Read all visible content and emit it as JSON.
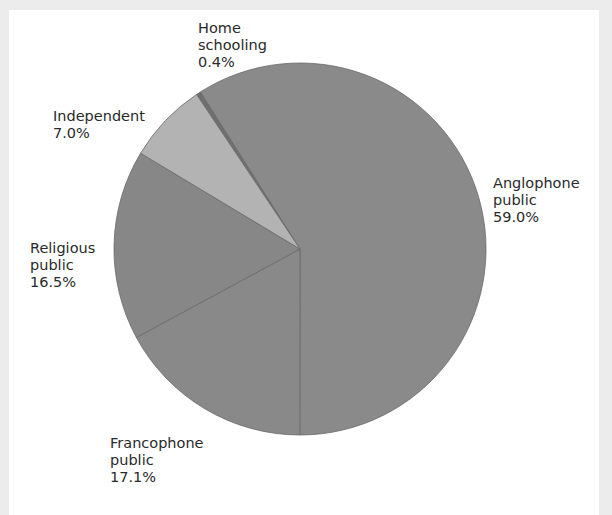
{
  "chart_data": {
    "type": "pie",
    "title": "",
    "start_angle_deg": 326.2,
    "direction": "clockwise",
    "center": [
      300,
      249
    ],
    "radius": 186,
    "slices": [
      {
        "name": "Home schooling",
        "label_lines": [
          "Home",
          "schooling"
        ],
        "value": 0.4,
        "value_label": "0.4%",
        "color": "#6f6f6f"
      },
      {
        "name": "Anglophone public",
        "label_lines": [
          "Anglophone",
          "public"
        ],
        "value": 59.0,
        "value_label": "59.0%",
        "color": "#8a8a8a"
      },
      {
        "name": "Francophone public",
        "label_lines": [
          "Francophone",
          "public"
        ],
        "value": 17.1,
        "value_label": "17.1%",
        "color": "#898989"
      },
      {
        "name": "Religious public",
        "label_lines": [
          "Religious",
          "public"
        ],
        "value": 16.5,
        "value_label": "16.5%",
        "color": "#878787"
      },
      {
        "name": "Independent",
        "label_lines": [
          "Independent"
        ],
        "value": 7.0,
        "value_label": "7.0%",
        "color": "#b3b3b3"
      }
    ],
    "legend": "none (direct labels)"
  },
  "labels": {
    "home": {
      "line1": "Home",
      "line2": "schooling",
      "value": "0.4%"
    },
    "anglophone": {
      "line1": "Anglophone",
      "line2": "public",
      "value": "59.0%"
    },
    "francophone": {
      "line1": "Francophone",
      "line2": "public",
      "value": "17.1%"
    },
    "religious": {
      "line1": "Religious",
      "line2": "public",
      "value": "16.5%"
    },
    "independent": {
      "line1": "Independent",
      "value": "7.0%"
    }
  }
}
